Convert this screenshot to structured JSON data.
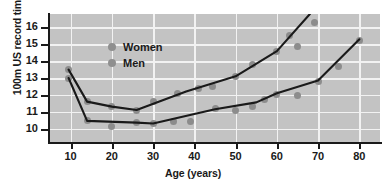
{
  "chart_data": {
    "type": "scatter",
    "title": "",
    "xlabel": "Age (years)",
    "ylabel": "100m US record times",
    "xlim": [
      5,
      85
    ],
    "ylim": [
      9.2,
      16.8
    ],
    "xticks": [
      10,
      20,
      30,
      40,
      50,
      60,
      70,
      80
    ],
    "yticks": [
      10,
      11,
      12,
      13,
      14,
      15,
      16
    ],
    "grid": true,
    "legend_position": "top-left",
    "marker_color": "#8c8c8c",
    "line_color": "#1a1a1a",
    "plot_background": "#c3c3c3",
    "gridline_color": "#f2f2f2",
    "series": [
      {
        "name": "Women",
        "points": [
          {
            "x": 9.5,
            "y": 13.5
          },
          {
            "x": 14,
            "y": 11.6
          },
          {
            "x": 20,
            "y": 11.3
          },
          {
            "x": 26,
            "y": 11.1
          },
          {
            "x": 30,
            "y": 11.6
          },
          {
            "x": 36,
            "y": 12.1
          },
          {
            "x": 41,
            "y": 12.4
          },
          {
            "x": 44.5,
            "y": 12.5
          },
          {
            "x": 50,
            "y": 13.1
          },
          {
            "x": 54,
            "y": 13.8
          },
          {
            "x": 60,
            "y": 14.6
          },
          {
            "x": 63,
            "y": 15.5
          },
          {
            "x": 65,
            "y": 14.9
          },
          {
            "x": 69,
            "y": 16.3
          }
        ],
        "fit": [
          {
            "x": 9.5,
            "y": 13.5
          },
          {
            "x": 14,
            "y": 11.6
          },
          {
            "x": 20,
            "y": 11.3
          },
          {
            "x": 26,
            "y": 11.1
          },
          {
            "x": 38,
            "y": 12.2
          },
          {
            "x": 50,
            "y": 13.1
          },
          {
            "x": 60,
            "y": 14.6
          },
          {
            "x": 68,
            "y": 16.8
          }
        ]
      },
      {
        "name": "Men",
        "points": [
          {
            "x": 9.5,
            "y": 13.0
          },
          {
            "x": 14,
            "y": 10.45
          },
          {
            "x": 20,
            "y": 10.1
          },
          {
            "x": 26,
            "y": 10.35
          },
          {
            "x": 30,
            "y": 10.3
          },
          {
            "x": 35,
            "y": 10.4
          },
          {
            "x": 39,
            "y": 10.4
          },
          {
            "x": 45,
            "y": 11.2
          },
          {
            "x": 50,
            "y": 11.1
          },
          {
            "x": 54,
            "y": 11.3
          },
          {
            "x": 57,
            "y": 11.7
          },
          {
            "x": 60,
            "y": 12.0
          },
          {
            "x": 65,
            "y": 11.95
          },
          {
            "x": 70,
            "y": 12.8
          },
          {
            "x": 75,
            "y": 13.7
          },
          {
            "x": 80,
            "y": 15.2
          }
        ],
        "fit": [
          {
            "x": 9.5,
            "y": 13.0
          },
          {
            "x": 14,
            "y": 10.45
          },
          {
            "x": 26,
            "y": 10.35
          },
          {
            "x": 30,
            "y": 10.3
          },
          {
            "x": 45,
            "y": 11.15
          },
          {
            "x": 55,
            "y": 11.55
          },
          {
            "x": 60,
            "y": 12.1
          },
          {
            "x": 70,
            "y": 12.85
          },
          {
            "x": 80,
            "y": 15.3
          }
        ]
      }
    ],
    "legend": [
      {
        "label": "Women"
      },
      {
        "label": "Men"
      }
    ]
  }
}
